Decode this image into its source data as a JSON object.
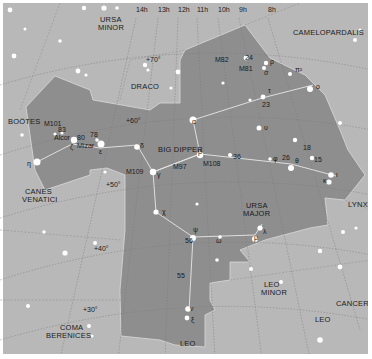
{
  "map": {
    "title": "Ursa Major star chart",
    "colors": {
      "sky": "#b7b7b7",
      "constellation_fill": "#8f8f8f",
      "border": "#ffffff",
      "text": "#1a1a1a",
      "star": "#ffffff"
    },
    "ra_labels": [
      {
        "text": "14h",
        "x": 136,
        "y": 12
      },
      {
        "text": "13h",
        "x": 158,
        "y": 12
      },
      {
        "text": "12h",
        "x": 178,
        "y": 12
      },
      {
        "text": "11h",
        "x": 197,
        "y": 12
      },
      {
        "text": "10h",
        "x": 218,
        "y": 12
      },
      {
        "text": "9h",
        "x": 239,
        "y": 12
      },
      {
        "text": "8h",
        "x": 268,
        "y": 12
      }
    ],
    "dec_labels": [
      {
        "text": "+70°",
        "x": 146,
        "y": 62
      },
      {
        "text": "+60°",
        "x": 126,
        "y": 123
      },
      {
        "text": "+50°",
        "x": 106,
        "y": 187
      },
      {
        "text": "+40°",
        "x": 94,
        "y": 251
      },
      {
        "text": "+30°",
        "x": 83,
        "y": 312
      }
    ],
    "constellations": [
      {
        "text": "URSA",
        "x": 100,
        "y": 22
      },
      {
        "text": "MINOR",
        "x": 98,
        "y": 30
      },
      {
        "text": "CAMELOPARDALIS",
        "x": 293,
        "y": 35
      },
      {
        "text": "DRACO",
        "x": 131,
        "y": 89
      },
      {
        "text": "BOÖTES",
        "x": 8,
        "y": 124
      },
      {
        "text": "BIG DIPPER",
        "x": 158,
        "y": 152
      },
      {
        "text": "CANES",
        "x": 25,
        "y": 194
      },
      {
        "text": "VENATICI",
        "x": 22,
        "y": 202
      },
      {
        "text": "URSA",
        "x": 246,
        "y": 208
      },
      {
        "text": "MAJOR",
        "x": 243,
        "y": 216
      },
      {
        "text": "LYNX",
        "x": 348,
        "y": 207
      },
      {
        "text": "LEO",
        "x": 264,
        "y": 287
      },
      {
        "text": "MINOR",
        "x": 261,
        "y": 295
      },
      {
        "text": "CANCER",
        "x": 336,
        "y": 306
      },
      {
        "text": "LEO",
        "x": 315,
        "y": 322
      },
      {
        "text": "COMA",
        "x": 60,
        "y": 330
      },
      {
        "text": "BERENICES",
        "x": 46,
        "y": 338
      },
      {
        "text": "LEO",
        "x": 180,
        "y": 346
      }
    ],
    "star_labels": [
      {
        "text": "M82",
        "x": 215,
        "y": 62
      },
      {
        "text": "24",
        "x": 245,
        "y": 60
      },
      {
        "text": "M81",
        "x": 239,
        "y": 71
      },
      {
        "text": "ρ",
        "x": 270,
        "y": 64
      },
      {
        "text": "σ",
        "x": 264,
        "y": 75
      },
      {
        "text": "π²",
        "x": 295,
        "y": 72
      },
      {
        "text": "τ",
        "x": 268,
        "y": 93
      },
      {
        "text": "ο",
        "x": 316,
        "y": 89
      },
      {
        "text": "23",
        "x": 262,
        "y": 107
      },
      {
        "text": "α",
        "x": 192,
        "y": 124
      },
      {
        "text": "υ",
        "x": 264,
        "y": 130
      },
      {
        "text": "18",
        "x": 303,
        "y": 150
      },
      {
        "text": "15",
        "x": 314,
        "y": 162
      },
      {
        "text": "β",
        "x": 198,
        "y": 154
      },
      {
        "text": "M108",
        "x": 203,
        "y": 166
      },
      {
        "text": "36",
        "x": 233,
        "y": 159
      },
      {
        "text": "φ",
        "x": 273,
        "y": 161
      },
      {
        "text": "26",
        "x": 282,
        "y": 160
      },
      {
        "text": "θ",
        "x": 295,
        "y": 163
      },
      {
        "text": "ι",
        "x": 336,
        "y": 177
      },
      {
        "text": "κ",
        "x": 323,
        "y": 183
      },
      {
        "text": "M101",
        "x": 44,
        "y": 126
      },
      {
        "text": "83",
        "x": 58,
        "y": 132
      },
      {
        "text": "Alcor",
        "x": 54,
        "y": 140
      },
      {
        "text": "80",
        "x": 77,
        "y": 140
      },
      {
        "text": "78",
        "x": 90,
        "y": 137
      },
      {
        "text": "ζ",
        "x": 70,
        "y": 149
      },
      {
        "text": "Mizar",
        "x": 77,
        "y": 148
      },
      {
        "text": "ε",
        "x": 99,
        "y": 154
      },
      {
        "text": "δ",
        "x": 140,
        "y": 148
      },
      {
        "text": "η",
        "x": 27,
        "y": 166
      },
      {
        "text": "M109",
        "x": 126,
        "y": 174
      },
      {
        "text": "γ",
        "x": 157,
        "y": 177
      },
      {
        "text": "M97",
        "x": 173,
        "y": 169
      },
      {
        "text": "χ",
        "x": 162,
        "y": 214
      },
      {
        "text": "ψ",
        "x": 193,
        "y": 232
      },
      {
        "text": "56",
        "x": 185,
        "y": 243
      },
      {
        "text": "ω",
        "x": 216,
        "y": 243
      },
      {
        "text": "μ",
        "x": 254,
        "y": 240
      },
      {
        "text": "λ",
        "x": 263,
        "y": 234
      },
      {
        "text": "55",
        "x": 177,
        "y": 278
      },
      {
        "text": "ν",
        "x": 190,
        "y": 311
      },
      {
        "text": "ξ",
        "x": 191,
        "y": 322
      }
    ]
  },
  "chart_data": {
    "type": "star-map",
    "right_ascension_ticks": [
      "14h",
      "13h",
      "12h",
      "11h",
      "10h",
      "9h",
      "8h"
    ],
    "declination_ticks": [
      "+70°",
      "+60°",
      "+50°",
      "+40°",
      "+30°"
    ],
    "highlighted_constellation": "Ursa Major",
    "asterism": "Big Dipper",
    "neighbors": [
      "Ursa Minor",
      "Camelopardalis",
      "Draco",
      "Boötes",
      "Canes Venatici",
      "Lynx",
      "Leo Minor",
      "Cancer",
      "Leo",
      "Coma Berenices"
    ],
    "deep_sky_objects": [
      "M81",
      "M82",
      "M97",
      "M101",
      "M108",
      "M109"
    ],
    "named_stars": [
      "Alcor",
      "Mizar"
    ]
  }
}
